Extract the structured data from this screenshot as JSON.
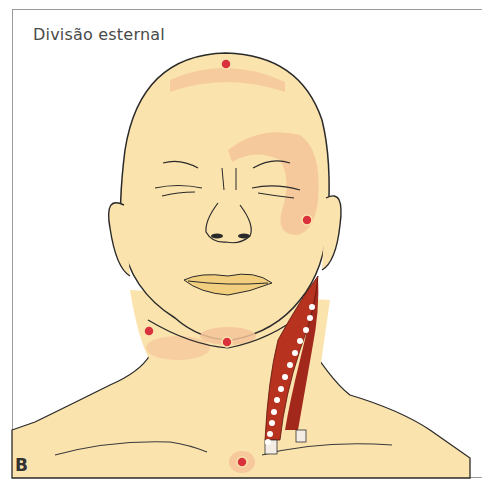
{
  "figure": {
    "title": "Divisão esternal",
    "panel_label": "B"
  },
  "colors": {
    "skin": "#fbe3ad",
    "zone": "#f5c49a",
    "trigger_point": "#d9323c",
    "muscle": "#a3281c",
    "outline": "#2a2a2a",
    "border": "#9a9a9a"
  },
  "trigger_points": [
    {
      "name": "vertex",
      "x": 226,
      "y": 64
    },
    {
      "name": "cheek-zygomatic",
      "x": 307,
      "y": 220
    },
    {
      "name": "submandibular",
      "x": 149,
      "y": 331
    },
    {
      "name": "chin",
      "x": 227,
      "y": 342
    },
    {
      "name": "sternal-notch",
      "x": 242,
      "y": 462
    }
  ],
  "muscle": {
    "name": "sternocleidomastoid-sternal-division",
    "points_count": 13
  }
}
